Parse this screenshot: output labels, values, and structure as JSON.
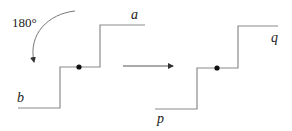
{
  "diagram": {
    "rotation_label": "180°",
    "left_figure": {
      "top_label": "a",
      "bottom_label": "b"
    },
    "right_figure": {
      "top_label": "q",
      "bottom_label": "p"
    },
    "colors": {
      "line": "#8a8a8a",
      "dot": "#111111",
      "text": "#222222"
    }
  }
}
